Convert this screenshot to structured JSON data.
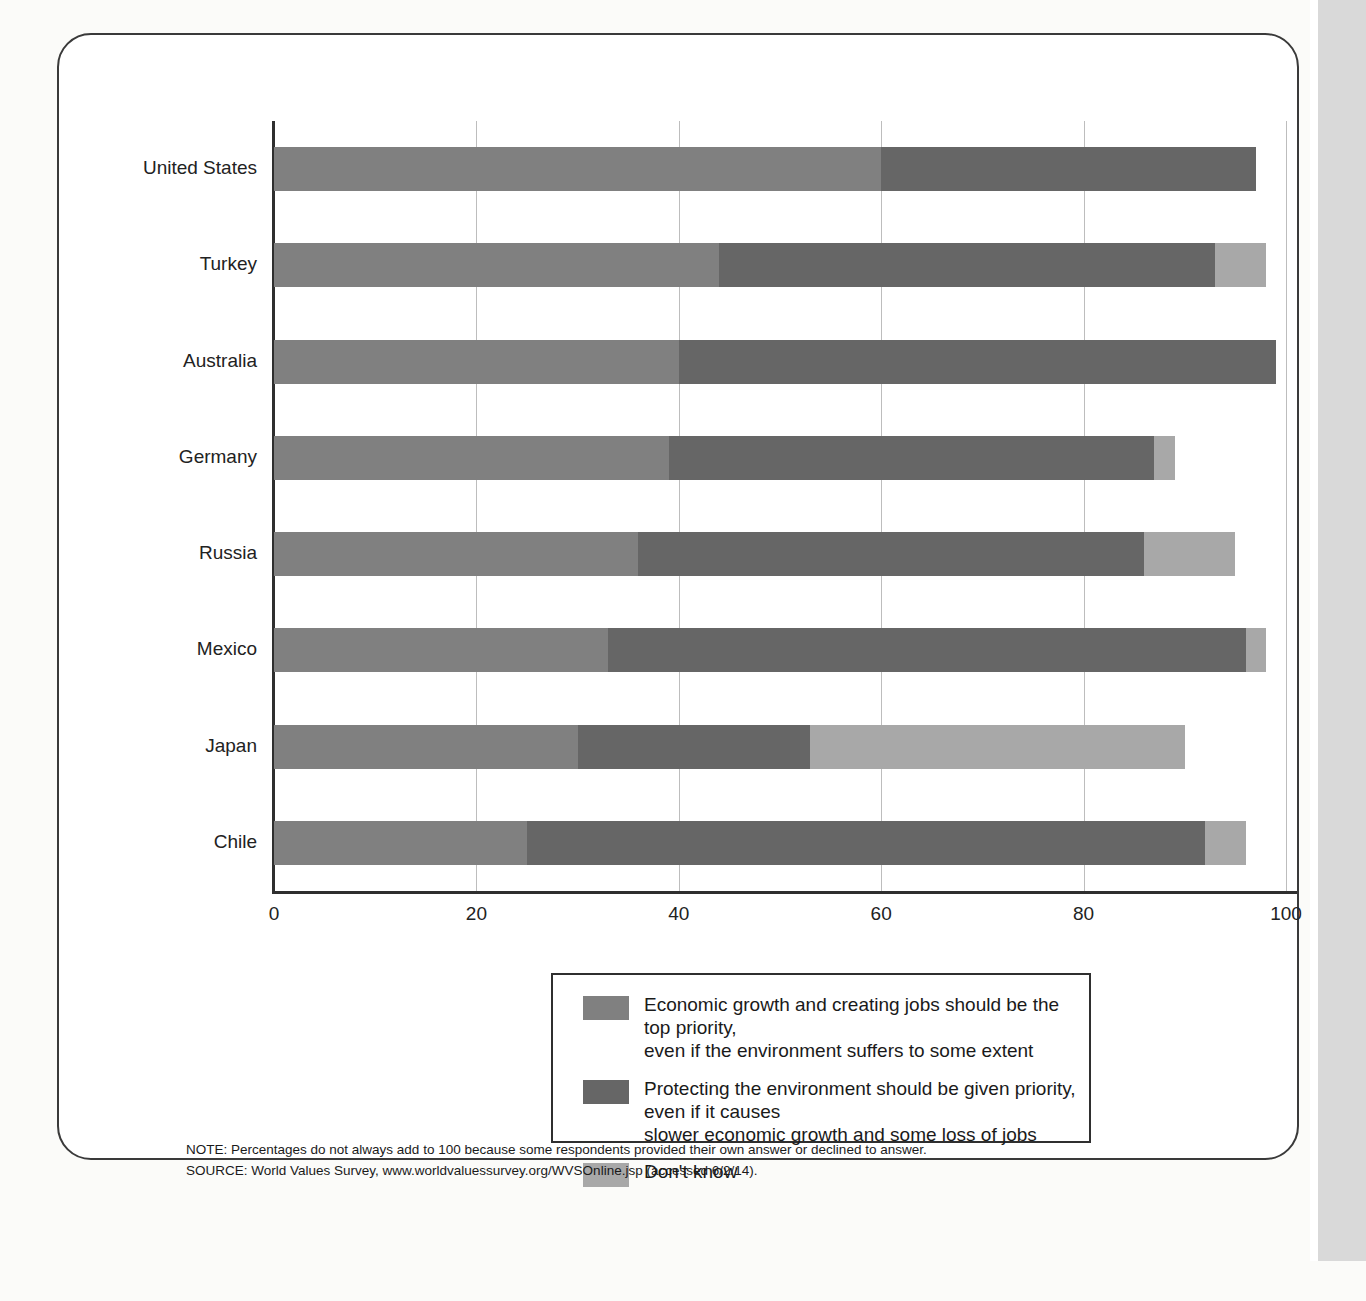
{
  "figure": {
    "notes": [
      "NOTE: Percentages do not always add to 100 because some respondents provided their own answer or declined to answer.",
      "SOURCE: World Values Survey, www.worldvaluessurvey.org/WVSOnline.jsp (accessed 6/2/14)."
    ]
  },
  "colors": {
    "economic_growth": "#808080",
    "protect_environment": "#666666",
    "dont_know": "#a8a8a8",
    "axis": "#2f2f2f",
    "grid": "#bdbdbd",
    "text": "#1a1a1a"
  },
  "legend": {
    "items": [
      {
        "key": "economic_growth",
        "swatch_color": "#808080",
        "label": "Economic growth and creating jobs should be the top priority,\neven if the environment suffers to some extent"
      },
      {
        "key": "protect_environment",
        "swatch_color": "#666666",
        "label": "Protecting the environment should be given priority, even if it causes\nslower economic growth and some loss of jobs"
      },
      {
        "key": "dont_know",
        "swatch_color": "#a8a8a8",
        "label": "Don't know"
      }
    ]
  },
  "chart_data": {
    "type": "bar",
    "orientation": "horizontal",
    "stacked": true,
    "title": "",
    "subtitle": "",
    "xlabel": "",
    "ylabel": "",
    "xlim": [
      0,
      100
    ],
    "xticks": [
      0,
      20,
      40,
      60,
      80,
      100
    ],
    "xtick_labels": [
      "0",
      "20",
      "40",
      "60",
      "80",
      "100"
    ],
    "grid": "vertical",
    "legend_position": "bottom",
    "categories": [
      "United States",
      "Turkey",
      "Australia",
      "Germany",
      "Russia",
      "Mexico",
      "Japan",
      "Chile"
    ],
    "series": [
      {
        "name": "Economic growth and creating jobs should be the top priority, even if the environment suffers to some extent",
        "short_name": "Economic growth",
        "color": "#808080",
        "values": [
          60,
          44,
          40,
          39,
          36,
          33,
          30,
          25
        ]
      },
      {
        "name": "Protecting the environment should be given priority, even if it causes slower economic growth and some loss of jobs",
        "short_name": "Protecting the environment",
        "color": "#666666",
        "values": [
          37,
          49,
          59,
          48,
          50,
          63,
          23,
          67
        ]
      },
      {
        "name": "Don't know",
        "short_name": "Don't know",
        "color": "#a8a8a8",
        "values": [
          0,
          5,
          0,
          2,
          9,
          2,
          37,
          4
        ]
      }
    ]
  }
}
